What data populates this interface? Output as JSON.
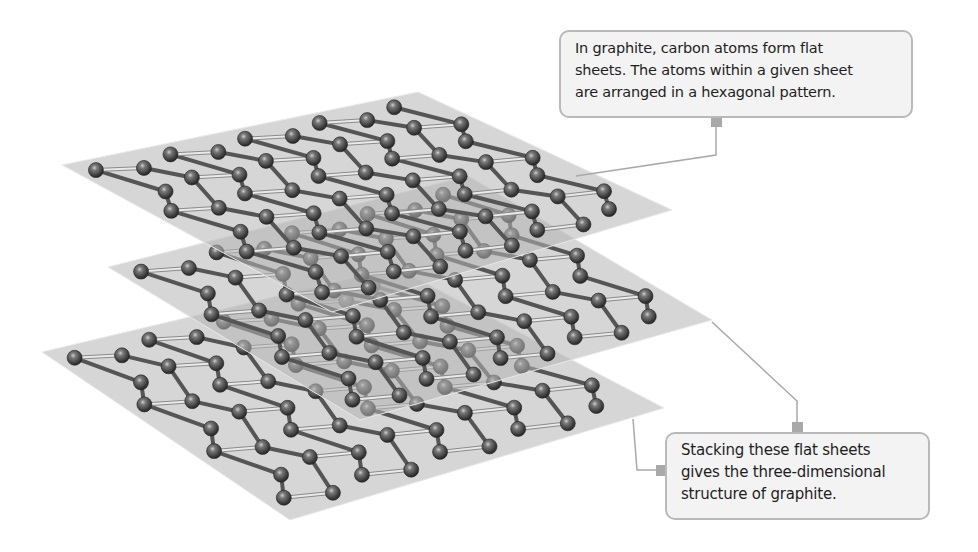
{
  "diagram": {
    "colors": {
      "background": "#ffffff",
      "sheet_fill": "#b4b4b4",
      "sheet_edge": "#e8e8e8",
      "atom_dark": "#2e2e2e",
      "atom_mid": "#6a6a6a",
      "atom_highlight": "#c8c8c8",
      "bond": "#eaeaea",
      "bond_outline": "#8a8a8a",
      "connector": "#a9a9a9",
      "callout_fill": "#f3f3f3",
      "callout_border": "#b9b9b9",
      "callout_text": "#1e1e1e"
    },
    "sheets": [
      {
        "name": "top-sheet",
        "corners": [
          [
            62,
            165
          ],
          [
            418,
            92
          ],
          [
            672,
            210
          ],
          [
            332,
            312
          ]
        ],
        "rows": 5,
        "cols": 10
      },
      {
        "name": "middle-sheet",
        "corners": [
          [
            108,
            267
          ],
          [
            468,
            176
          ],
          [
            712,
            320
          ],
          [
            360,
            420
          ]
        ],
        "rows": 5,
        "cols": 10
      },
      {
        "name": "bottom-sheet",
        "corners": [
          [
            42,
            352
          ],
          [
            396,
            268
          ],
          [
            664,
            408
          ],
          [
            290,
            520
          ]
        ],
        "rows": 5,
        "cols": 10
      }
    ],
    "callouts": [
      {
        "id": "top",
        "lines": [
          "In graphite, carbon atoms form flat",
          "sheets. The atoms within a given sheet",
          "are arranged in a hexagonal pattern."
        ],
        "connector_points": [
          [
            716,
            118
          ],
          [
            716,
            155
          ],
          [
            576,
            176
          ]
        ],
        "tab": [
          711,
          118
        ]
      },
      {
        "id": "bottom",
        "lines": [
          "Stacking these flat sheets",
          "gives the three-dimensional",
          "structure of graphite."
        ],
        "connector_points": [
          [
            797,
            432
          ],
          [
            797,
            401
          ],
          [
            712,
            322
          ]
        ],
        "connector2_points": [
          [
            665,
            470
          ],
          [
            637,
            470
          ],
          [
            633,
            419
          ]
        ],
        "tab": [
          792,
          422
        ],
        "tab2": [
          656,
          465
        ]
      }
    ]
  }
}
